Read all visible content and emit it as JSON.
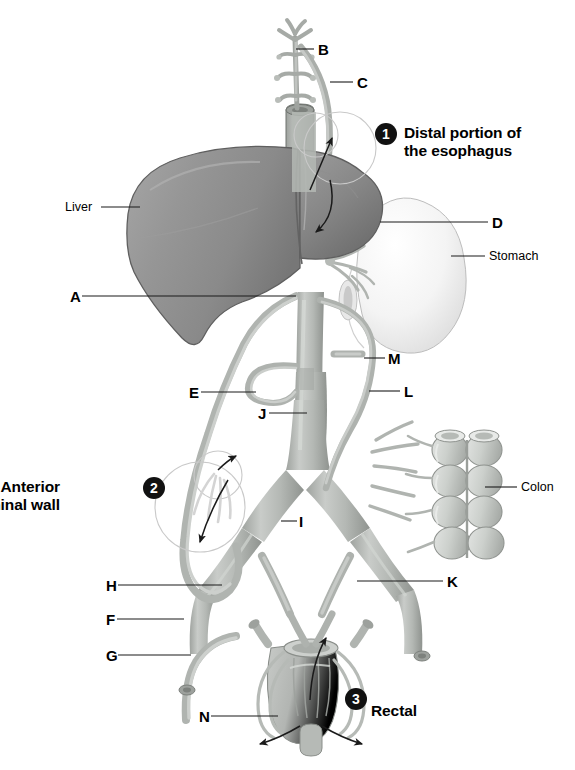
{
  "figure": {
    "type": "anatomy-diagram"
  },
  "letter_labels": [
    {
      "id": "B",
      "text": "B",
      "x": 318,
      "y": 42,
      "line": {
        "x1": 314,
        "y1": 49,
        "x2": 296,
        "y2": 49
      }
    },
    {
      "id": "C",
      "text": "C",
      "x": 357,
      "y": 75,
      "line": {
        "x1": 353,
        "y1": 82,
        "x2": 330,
        "y2": 82
      }
    },
    {
      "id": "D",
      "text": "D",
      "x": 492,
      "y": 215,
      "line": {
        "x1": 488,
        "y1": 222,
        "x2": 380,
        "y2": 222
      }
    },
    {
      "id": "A",
      "text": "A",
      "x": 70,
      "y": 289,
      "line": {
        "x1": 82,
        "y1": 296,
        "x2": 296,
        "y2": 296
      }
    },
    {
      "id": "M",
      "text": "M",
      "x": 388,
      "y": 351,
      "line": {
        "x1": 385,
        "y1": 358,
        "x2": 364,
        "y2": 358
      }
    },
    {
      "id": "E",
      "text": "E",
      "x": 189,
      "y": 385,
      "line": {
        "x1": 201,
        "y1": 392,
        "x2": 256,
        "y2": 392
      }
    },
    {
      "id": "L",
      "text": "L",
      "x": 404,
      "y": 384,
      "line": {
        "x1": 400,
        "y1": 391,
        "x2": 369,
        "y2": 391
      }
    },
    {
      "id": "J",
      "text": "J",
      "x": 258,
      "y": 406,
      "line": {
        "x1": 269,
        "y1": 413,
        "x2": 307,
        "y2": 413
      }
    },
    {
      "id": "I",
      "text": "I",
      "x": 299,
      "y": 514,
      "line": {
        "x1": 297,
        "y1": 521,
        "x2": 281,
        "y2": 521
      }
    },
    {
      "id": "H",
      "text": "H",
      "x": 106,
      "y": 578,
      "line": {
        "x1": 118,
        "y1": 585,
        "x2": 222,
        "y2": 585
      }
    },
    {
      "id": "K",
      "text": "K",
      "x": 447,
      "y": 574,
      "line": {
        "x1": 443,
        "y1": 581,
        "x2": 357,
        "y2": 581
      }
    },
    {
      "id": "F",
      "text": "F",
      "x": 106,
      "y": 612,
      "line": {
        "x1": 117,
        "y1": 619,
        "x2": 184,
        "y2": 619
      }
    },
    {
      "id": "G",
      "text": "G",
      "x": 106,
      "y": 648,
      "line": {
        "x1": 118,
        "y1": 655,
        "x2": 191,
        "y2": 655
      }
    },
    {
      "id": "N",
      "text": "N",
      "x": 199,
      "y": 709,
      "line": {
        "x1": 211,
        "y1": 716,
        "x2": 278,
        "y2": 716
      }
    }
  ],
  "organ_labels": [
    {
      "id": "liver",
      "text": "Liver",
      "x": 65,
      "y": 200,
      "line": {
        "x1": 101,
        "y1": 207,
        "x2": 140,
        "y2": 207
      }
    },
    {
      "id": "stomach",
      "text": "Stomach",
      "x": 489,
      "y": 249,
      "line": {
        "x1": 451,
        "y1": 256,
        "x2": 485,
        "y2": 256
      }
    },
    {
      "id": "colon",
      "text": "Colon",
      "x": 521,
      "y": 480,
      "line": {
        "x1": 485,
        "y1": 487,
        "x2": 517,
        "y2": 487
      }
    }
  ],
  "callouts": [
    {
      "id": "callout-1",
      "number": "1",
      "number_x": 375,
      "number_y": 123,
      "lines": [
        "Distal portion of",
        "the esophagus"
      ],
      "text_x": 404,
      "text_y": 124
    },
    {
      "id": "callout-2",
      "number": "2",
      "number_x": 143,
      "number_y": 477,
      "lines": [
        "Anterior",
        "abdominal wall"
      ],
      "text_x": 60,
      "text_y": 478,
      "align": "right"
    },
    {
      "id": "callout-3",
      "number": "3",
      "number_x": 345,
      "number_y": 688,
      "lines": [
        "Rectal"
      ],
      "text_x": 371,
      "text_y": 702
    }
  ],
  "colors": {
    "background": "#ffffff",
    "liver": "#8f8f8f",
    "liver_dark": "#6e6e6e",
    "liver_light": "#a7a7a7",
    "stomach": "#f2f2f2",
    "stomach_shade": "#d8d8d8",
    "vessel": "#b6b9b6",
    "vessel_dark": "#8d918d",
    "vessel_light": "#d3d6d3",
    "colon": "#cfd2cf",
    "rectum": "#b9bcb9",
    "leader_line": "#1a1a1a",
    "marker_fill": "#111111",
    "marker_text": "#ffffff",
    "ghost_circle": "#c9c9c9",
    "arrow": "#1a1a1a"
  }
}
